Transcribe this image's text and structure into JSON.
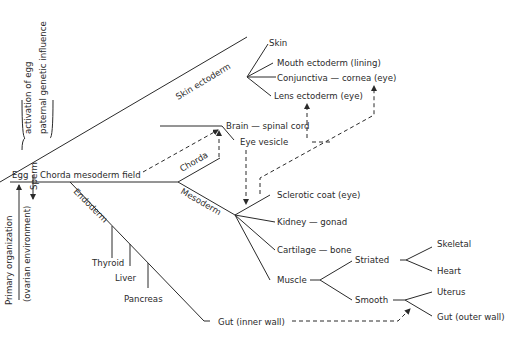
{
  "diagram": {
    "type": "embryonic-development-lineage-tree",
    "root": "Egg",
    "side_labels": {
      "sperm": "Sperm",
      "activation": "activation of egg",
      "paternal": "paternal genetic influence",
      "primary_org": "Primary organization",
      "ovarian_env": "(ovarian environment)"
    },
    "main_axis": "Chorda  mesoderm field",
    "branches": {
      "skin_ectoderm": {
        "label": "Skin ectoderm",
        "children": [
          "Skin",
          "Mouth ectoderm (lining)",
          "Conjunctiva — cornea (eye)",
          "Lens ectoderm (eye)"
        ]
      },
      "neural": [
        "Brain — spinal cord",
        "Eye vesicle"
      ],
      "chorda": {
        "label": "Chorda"
      },
      "mesoderm": {
        "label": "Mesoderm",
        "children": [
          "Sclerotic coat (eye)",
          "Kidney — gonad",
          "Cartilage — bone",
          "Muscle"
        ],
        "muscle": {
          "striated": {
            "label": "Striated",
            "children": [
              "Skeletal",
              "Heart"
            ]
          },
          "smooth": {
            "label": "Smooth",
            "children": [
              "Uterus",
              "Gut (outer wall)"
            ]
          }
        }
      },
      "endoderm": {
        "label": "Endoderm",
        "children": [
          "Thyroid",
          "Liver",
          "Pancreas",
          "Gut (inner wall)"
        ]
      }
    },
    "induction_arrows": [
      {
        "from": "Chorda mesoderm field",
        "to": "Brain — spinal cord"
      },
      {
        "from": "Chorda",
        "to": "Brain — spinal cord"
      },
      {
        "from": "Eye vesicle",
        "to": "Lens ectoderm (eye)"
      },
      {
        "from": "Eye vesicle",
        "to": "Mesoderm (Sclerotic coat)"
      },
      {
        "from": "Sclerotic coat (eye)",
        "to": "Conjunctiva — cornea (eye)"
      },
      {
        "from": "Gut (inner wall)",
        "to": "Gut (outer wall)"
      }
    ]
  }
}
